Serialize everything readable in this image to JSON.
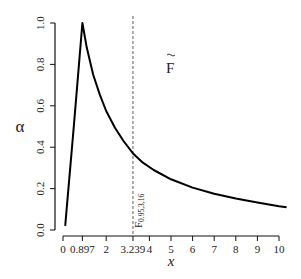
{
  "chart_data": {
    "type": "line",
    "title": "",
    "xlabel": "x",
    "ylabel": "α",
    "xlim": [
      -0.35,
      10.45
    ],
    "ylim": [
      -0.04,
      1.04
    ],
    "x_ticks": [
      0,
      0.897,
      2,
      3.239,
      4,
      5,
      6,
      7,
      8,
      9,
      10
    ],
    "x_tick_labels": [
      "0",
      "0.897",
      "2",
      "3.239",
      "4",
      "5",
      "6",
      "7",
      "8",
      "9",
      "10"
    ],
    "y_ticks": [
      0.0,
      0.2,
      0.4,
      0.6,
      0.8,
      1.0
    ],
    "y_tick_labels": [
      "0.0",
      "0.2",
      "0.4",
      "0.6",
      "0.8",
      "1.0"
    ],
    "grid": false,
    "legend": null,
    "series": [
      {
        "name": "alpha curve",
        "x": [
          0.1,
          0.3,
          0.5,
          0.7,
          0.897,
          1.1,
          1.4,
          1.7,
          2.0,
          2.4,
          2.8,
          3.239,
          3.7,
          4.2,
          5.0,
          6.0,
          7.0,
          8.0,
          9.0,
          10.0,
          10.35
        ],
        "y": [
          0.02,
          0.26,
          0.5,
          0.75,
          1.0,
          0.88,
          0.75,
          0.655,
          0.575,
          0.495,
          0.43,
          0.37,
          0.325,
          0.29,
          0.245,
          0.205,
          0.175,
          0.152,
          0.133,
          0.115,
          0.11
        ]
      }
    ],
    "annotations": [
      {
        "type": "vline",
        "x": 3.239,
        "style": "dashed",
        "label": "F0.95,3,16"
      },
      {
        "type": "text",
        "text": "F̃",
        "x": 5.0,
        "y": 0.82
      }
    ]
  },
  "labels": {
    "xlabel": "x",
    "ylabel": "α",
    "vline_label_main": "F",
    "vline_label_sub": "0.95,3,16",
    "f_tilde": "F"
  }
}
